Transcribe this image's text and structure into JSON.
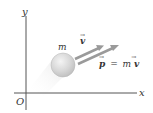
{
  "diagram": {
    "axes": {
      "y_label": "y",
      "x_label": "x",
      "origin_label": "O"
    },
    "particle": {
      "mass_label": "m"
    },
    "vectors": {
      "velocity_label": "v",
      "velocity_arrow": "→",
      "momentum_label": "p",
      "momentum_arrow": "→",
      "momentum_eq": "=",
      "momentum_m": "m",
      "momentum_v": "v",
      "momentum_v_arrow": "→"
    },
    "colors": {
      "axis": "#555555",
      "arrow": "#9a9a9a",
      "sphere": "#d8d8d8",
      "sphere_shadow": "#eeeeee"
    }
  }
}
